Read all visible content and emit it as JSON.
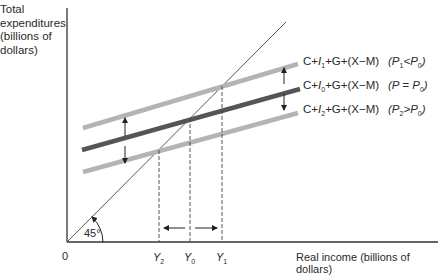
{
  "diagram": {
    "y_axis_label": "Total expenditures (billions of dollars)",
    "y_axis_label_lines": [
      "Total",
      "expenditures",
      "(billions of",
      "dollars)"
    ],
    "x_axis_label": "Real income (billions of dollars)",
    "origin_label": "0",
    "angle_label": "45°",
    "income_ticks": [
      {
        "name": "Y",
        "sub": "2"
      },
      {
        "name": "Y",
        "sub": "0"
      },
      {
        "name": "Y",
        "sub": "1"
      }
    ],
    "curves": [
      {
        "label_prefix": "C+",
        "label_I": "I",
        "label_I_sub": "1",
        "label_suffix": "+G+(X−M)",
        "condition_P": "P",
        "condition_P_sub": "1",
        "condition_op": "<",
        "condition_rhs": "P",
        "condition_rhs_sub": "0",
        "color": "#b4b4b4"
      },
      {
        "label_prefix": "C+",
        "label_I": "I",
        "label_I_sub": "0",
        "label_suffix": "+G+(X−M)",
        "condition_P": "P",
        "condition_P_sub": "",
        "condition_op": " = ",
        "condition_rhs": "P",
        "condition_rhs_sub": "0",
        "color": "#555555"
      },
      {
        "label_prefix": "C+",
        "label_I": "I",
        "label_I_sub": "2",
        "label_suffix": "+G+(X−M)",
        "condition_P": "P",
        "condition_P_sub": "2",
        "condition_op": ">",
        "condition_rhs": "P",
        "condition_rhs_sub": "0",
        "color": "#b4b4b4"
      }
    ]
  }
}
